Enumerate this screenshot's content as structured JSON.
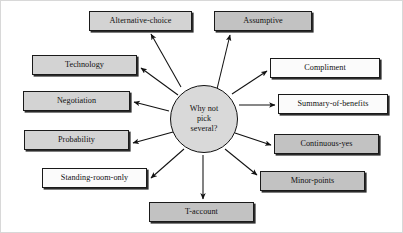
{
  "diagram": {
    "type": "hub-and-spoke",
    "hub": {
      "id": "hub",
      "lines": [
        "Why not",
        "pick",
        "several?"
      ],
      "text": "Why not pick several?",
      "center": {
        "x": 203,
        "y": 118
      },
      "radius": 34,
      "fill": "#d9d9d9",
      "stroke": "#111111"
    },
    "colors": {
      "shade_dark": "#c2c2c2",
      "shade_mid": "#d3d3d3",
      "shade_light": "#fbfbfb",
      "stroke": "#1a1a1a",
      "shadow": "#2b2b2b",
      "background": "#ffffff",
      "text": "#111111"
    },
    "nodes": [
      {
        "id": "alternative-choice",
        "label": "Alternative-choice",
        "shade": "shade-mid",
        "x": 88,
        "y": 10,
        "w": 103,
        "h": 20,
        "anchor": {
          "x": 148,
          "y": 30
        },
        "arrow_from": {
          "x": 180,
          "y": 86
        },
        "arrow_to": {
          "x": 150,
          "y": 33
        }
      },
      {
        "id": "assumptive",
        "label": "Assumptive",
        "shade": "shade-dark",
        "x": 213,
        "y": 10,
        "w": 98,
        "h": 20,
        "anchor": {
          "x": 232,
          "y": 30
        },
        "arrow_from": {
          "x": 216,
          "y": 88
        },
        "arrow_to": {
          "x": 229,
          "y": 34
        }
      },
      {
        "id": "technology",
        "label": "Technology",
        "shade": "shade-mid",
        "x": 31,
        "y": 54,
        "w": 105,
        "h": 20,
        "anchor": {
          "x": 136,
          "y": 66
        },
        "arrow_from": {
          "x": 177,
          "y": 94
        },
        "arrow_to": {
          "x": 140,
          "y": 67
        }
      },
      {
        "id": "negotiation",
        "label": "Negotiation",
        "shade": "shade-mid",
        "x": 22,
        "y": 90,
        "w": 107,
        "h": 20,
        "anchor": {
          "x": 129,
          "y": 100
        },
        "arrow_from": {
          "x": 168,
          "y": 110
        },
        "arrow_to": {
          "x": 133,
          "y": 101
        }
      },
      {
        "id": "probability",
        "label": "Probability",
        "shade": "shade-mid",
        "x": 23,
        "y": 129,
        "w": 105,
        "h": 20,
        "anchor": {
          "x": 128,
          "y": 140
        },
        "arrow_from": {
          "x": 172,
          "y": 131
        },
        "arrow_to": {
          "x": 132,
          "y": 142
        }
      },
      {
        "id": "standing-room-only",
        "label": "Standing-room-only",
        "shade": "shade-light",
        "x": 41,
        "y": 167,
        "w": 105,
        "h": 20,
        "anchor": {
          "x": 146,
          "y": 178
        },
        "arrow_from": {
          "x": 183,
          "y": 148
        },
        "arrow_to": {
          "x": 150,
          "y": 177
        }
      },
      {
        "id": "t-account",
        "label": "T-account",
        "shade": "shade-dark",
        "x": 148,
        "y": 201,
        "w": 105,
        "h": 20,
        "anchor": {
          "x": 200,
          "y": 201
        },
        "arrow_from": {
          "x": 202,
          "y": 154
        },
        "arrow_to": {
          "x": 202,
          "y": 198
        }
      },
      {
        "id": "minor-points",
        "label": "Minor-points",
        "shade": "shade-dark",
        "x": 259,
        "y": 170,
        "w": 105,
        "h": 20,
        "anchor": {
          "x": 259,
          "y": 175
        },
        "arrow_from": {
          "x": 224,
          "y": 148
        },
        "arrow_to": {
          "x": 256,
          "y": 174
        }
      },
      {
        "id": "continuous-yes",
        "label": "Continuous-yes",
        "shade": "shade-dark",
        "x": 273,
        "y": 133,
        "w": 105,
        "h": 20,
        "anchor": {
          "x": 273,
          "y": 143
        },
        "arrow_from": {
          "x": 234,
          "y": 132
        },
        "arrow_to": {
          "x": 270,
          "y": 144
        }
      },
      {
        "id": "summary-of-benefits",
        "label": "Summary-of-benefits",
        "shade": "shade-light",
        "x": 277,
        "y": 93,
        "w": 110,
        "h": 20,
        "anchor": {
          "x": 277,
          "y": 103
        },
        "arrow_from": {
          "x": 238,
          "y": 104
        },
        "arrow_to": {
          "x": 274,
          "y": 104
        }
      },
      {
        "id": "compliment",
        "label": "Compliment",
        "shade": "shade-light",
        "x": 269,
        "y": 57,
        "w": 110,
        "h": 20,
        "anchor": {
          "x": 269,
          "y": 69
        },
        "arrow_from": {
          "x": 231,
          "y": 93
        },
        "arrow_to": {
          "x": 266,
          "y": 70
        }
      }
    ]
  }
}
